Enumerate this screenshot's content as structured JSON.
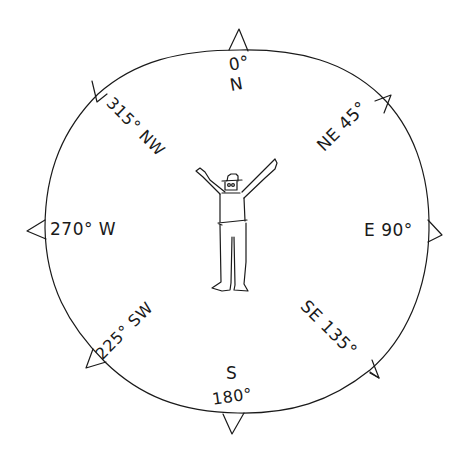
{
  "compass": {
    "center": {
      "x": 236,
      "y": 231
    },
    "radius_x": 186,
    "radius_y": 182,
    "stroke_color": "#1a1a1a",
    "background_color": "#ffffff",
    "directions": [
      {
        "id": "n",
        "degree_label": "0°",
        "letter_label": "N",
        "angle": 0
      },
      {
        "id": "ne",
        "label": "NE 45°",
        "angle": 45
      },
      {
        "id": "e",
        "label": "E 90°",
        "angle": 90
      },
      {
        "id": "se",
        "label": "SE 135°",
        "angle": 135
      },
      {
        "id": "s",
        "letter_label": "S",
        "degree_label": "180°",
        "angle": 180
      },
      {
        "id": "sw",
        "label": "225° SW",
        "angle": 225
      },
      {
        "id": "w",
        "label": "270° W",
        "angle": 270
      },
      {
        "id": "nw",
        "label": "315° NW",
        "angle": 315
      }
    ]
  }
}
